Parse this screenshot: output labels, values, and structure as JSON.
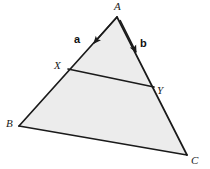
{
  "figure": {
    "kind": "geometry-diagram",
    "background_color": "#ffffff",
    "fill_color": "#ececec",
    "stroke_color": "#1a1a1a",
    "stroke_width": 1.6,
    "width": 210,
    "height": 169
  },
  "vertices": [
    {
      "id": "A",
      "label": "A",
      "x": 117,
      "y": 17
    },
    {
      "id": "B",
      "label": "B",
      "x": 19,
      "y": 126
    },
    {
      "id": "C",
      "label": "C",
      "x": 187,
      "y": 155
    },
    {
      "id": "X",
      "label": "X",
      "x": 68,
      "y": 69
    },
    {
      "id": "Y",
      "label": "Y",
      "x": 154,
      "y": 87
    }
  ],
  "edges": [
    {
      "id": "AB",
      "from": "A",
      "to": "B"
    },
    {
      "id": "AC",
      "from": "A",
      "to": "C"
    },
    {
      "id": "BC",
      "from": "B",
      "to": "C"
    },
    {
      "id": "XY",
      "from": "X",
      "to": "Y"
    }
  ],
  "vectors": [
    {
      "id": "a",
      "label": "a",
      "along_edge": "AB",
      "direction": "A-to-B",
      "tail_x": 117,
      "tail_y": 17,
      "head_x": 94,
      "head_y": 43,
      "label_x": 78,
      "label_y": 40
    },
    {
      "id": "b",
      "label": "b",
      "along_edge": "AC",
      "direction": "A-to-C",
      "tail_x": 120,
      "tail_y": 20,
      "head_x": 136,
      "head_y": 52,
      "label_x": 144,
      "label_y": 44
    }
  ]
}
